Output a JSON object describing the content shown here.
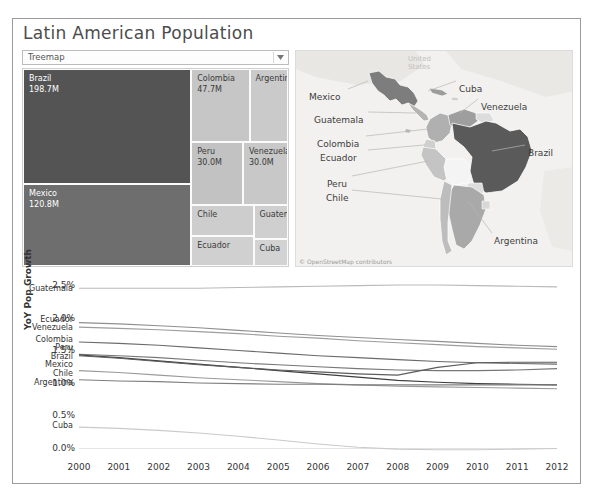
{
  "dashboard": {
    "title": "Latin American Population",
    "parameter": {
      "value": "Treemap",
      "options": [
        "Treemap",
        "Map",
        "Bar Chart"
      ],
      "arrow_icon": "chevron-down-icon"
    }
  },
  "treemap": {
    "cells": [
      {
        "name": "Brazil",
        "value": "198.7M",
        "pop": 198.7,
        "x": 0,
        "y": 0,
        "w": 63.5,
        "h": 58.5,
        "shade": "#545454",
        "tone": "dark",
        "show_value": true
      },
      {
        "name": "Mexico",
        "value": "120.8M",
        "pop": 120.8,
        "x": 0,
        "y": 58.5,
        "w": 63.5,
        "h": 41.5,
        "shade": "#6e6e6e",
        "tone": "dark",
        "show_value": true
      },
      {
        "name": "Colombia",
        "value": "47.7M",
        "pop": 47.7,
        "x": 63.5,
        "y": 0,
        "w": 22.0,
        "h": 37.0,
        "shade": "#c6c6c6",
        "tone": "light",
        "show_value": true
      },
      {
        "name": "Argentina",
        "value": "41.1M",
        "pop": 41.1,
        "x": 85.5,
        "y": 0,
        "w": 14.5,
        "h": 37.0,
        "shade": "#cacaca",
        "tone": "light",
        "show_value": false
      },
      {
        "name": "Peru",
        "value": "30.0M",
        "pop": 30.0,
        "x": 63.5,
        "y": 37.0,
        "w": 19.5,
        "h": 32.0,
        "shade": "#c2c2c2",
        "tone": "light",
        "show_value": true
      },
      {
        "name": "Venezuela",
        "value": "30.0M",
        "pop": 30.0,
        "x": 83.0,
        "y": 37.0,
        "w": 17.0,
        "h": 32.0,
        "shade": "#c8c8c8",
        "tone": "light",
        "show_value": true
      },
      {
        "name": "Chile",
        "value": "17.4M",
        "pop": 17.4,
        "x": 63.5,
        "y": 69.0,
        "w": 23.5,
        "h": 16.0,
        "shade": "#cdcdcd",
        "tone": "light",
        "show_value": false
      },
      {
        "name": "Ecuador",
        "value": "15.5M",
        "pop": 15.5,
        "x": 63.5,
        "y": 85.0,
        "w": 23.5,
        "h": 15.0,
        "shade": "#d0d0d0",
        "tone": "light",
        "show_value": false
      },
      {
        "name": "Guatemala",
        "value": "15.1M",
        "pop": 15.1,
        "x": 87.0,
        "y": 69.0,
        "w": 13.0,
        "h": 17.5,
        "shade": "#cfcfcf",
        "tone": "light",
        "show_value": false
      },
      {
        "name": "Cuba",
        "value": "11.3M",
        "pop": 11.3,
        "x": 87.0,
        "y": 86.5,
        "w": 13.0,
        "h": 13.5,
        "shade": "#d3d3d3",
        "tone": "light",
        "show_value": false
      }
    ]
  },
  "map": {
    "attribution": "© OpenStreetMap contributors",
    "labels": [
      {
        "name": "Mexico",
        "x": 13,
        "y": 41
      },
      {
        "name": "Guatemala",
        "x": 18,
        "y": 64
      },
      {
        "name": "Colombia",
        "x": 21,
        "y": 88
      },
      {
        "name": "Ecuador",
        "x": 24,
        "y": 102
      },
      {
        "name": "Peru",
        "x": 31,
        "y": 128
      },
      {
        "name": "Chile",
        "x": 30,
        "y": 142
      },
      {
        "name": "Cuba",
        "x": 163,
        "y": 33
      },
      {
        "name": "Venezuela",
        "x": 185,
        "y": 51
      },
      {
        "name": "Brazil",
        "x": 232,
        "y": 97
      },
      {
        "name": "Argentina",
        "x": 198,
        "y": 185
      }
    ],
    "region_shades": {
      "brazil": "#5a5a5a",
      "mexico": "#7d7d7d",
      "argentina": "#a9a9a9",
      "colombia": "#b0b0b0",
      "venezuela": "#9e9e9e",
      "peru": "#c4c4c4",
      "chile": "#bdbdbd",
      "ecuador": "#cfcfcf",
      "bolivia": "#f2f2f2",
      "other": "#e3e3e3"
    }
  },
  "chart_data": {
    "type": "line",
    "title": "",
    "xlabel": "",
    "ylabel": "YoY Pop Growth",
    "x": [
      2000,
      2001,
      2002,
      2003,
      2004,
      2005,
      2006,
      2007,
      2008,
      2009,
      2010,
      2011,
      2012
    ],
    "xtick_labels": [
      "2000",
      "2001",
      "2002",
      "2003",
      "2004",
      "2005",
      "2006",
      "2007",
      "2008",
      "2009",
      "2010",
      "2011",
      "2012"
    ],
    "ytick_labels": [
      "0.0%",
      "0.5%",
      "1.0%",
      "1.5%",
      "2.0%",
      "2.5%"
    ],
    "ytick_values": [
      0.0,
      0.5,
      1.0,
      1.5,
      2.0,
      2.5
    ],
    "ylim": [
      -0.1,
      2.75
    ],
    "xlim": [
      2000,
      2012
    ],
    "grid": false,
    "legend": "inline-left-labels",
    "series": [
      {
        "name": "Guatemala",
        "color": "#b9b9b9",
        "label_y": 2.48,
        "values": [
          2.47,
          2.47,
          2.47,
          2.47,
          2.48,
          2.49,
          2.5,
          2.51,
          2.52,
          2.52,
          2.51,
          2.5,
          2.49
        ]
      },
      {
        "name": "Ecuador",
        "color": "#8f8f8f",
        "label_y": 2.0,
        "values": [
          1.94,
          1.92,
          1.89,
          1.86,
          1.82,
          1.78,
          1.74,
          1.71,
          1.68,
          1.65,
          1.62,
          1.59,
          1.57
        ]
      },
      {
        "name": "Venezuela",
        "color": "#9d9d9d",
        "label_y": 1.87,
        "values": [
          1.87,
          1.85,
          1.83,
          1.8,
          1.77,
          1.73,
          1.7,
          1.66,
          1.63,
          1.6,
          1.57,
          1.55,
          1.53
        ]
      },
      {
        "name": "Colombia",
        "color": "#6b6b6b",
        "label_y": 1.69,
        "values": [
          1.64,
          1.62,
          1.59,
          1.55,
          1.51,
          1.47,
          1.43,
          1.4,
          1.37,
          1.34,
          1.32,
          1.31,
          1.3
        ]
      },
      {
        "name": "Peru",
        "color": "#777777",
        "label_y": 1.56,
        "values": [
          1.45,
          1.43,
          1.4,
          1.36,
          1.32,
          1.29,
          1.26,
          1.23,
          1.21,
          1.2,
          1.2,
          1.21,
          1.23
        ]
      },
      {
        "name": "Brazil",
        "color": "#3f3f3f",
        "label_y": 1.42,
        "values": [
          1.44,
          1.4,
          1.35,
          1.3,
          1.25,
          1.2,
          1.15,
          1.1,
          1.05,
          1.02,
          1.0,
          0.99,
          0.98
        ]
      },
      {
        "name": "Mexico",
        "color": "#5c5c5c",
        "label_y": 1.3,
        "values": [
          1.43,
          1.39,
          1.34,
          1.29,
          1.25,
          1.21,
          1.18,
          1.15,
          1.13,
          1.25,
          1.32,
          1.33,
          1.33
        ]
      },
      {
        "name": "Chile",
        "color": "#9a9a9a",
        "label_y": 1.17,
        "values": [
          1.2,
          1.17,
          1.13,
          1.09,
          1.06,
          1.03,
          1.0,
          0.98,
          0.96,
          0.95,
          0.94,
          0.93,
          0.92
        ]
      },
      {
        "name": "Argentina",
        "color": "#7f7f7f",
        "label_y": 1.02,
        "values": [
          1.06,
          1.04,
          1.03,
          1.01,
          1.0,
          0.99,
          0.99,
          0.98,
          0.98,
          0.98,
          0.98,
          0.98,
          0.98
        ]
      },
      {
        "name": "Cuba",
        "color": "#cacaca",
        "label_y": 0.36,
        "values": [
          0.33,
          0.31,
          0.28,
          0.24,
          0.19,
          0.13,
          0.07,
          0.02,
          -0.01,
          -0.02,
          -0.02,
          -0.01,
          0.0
        ]
      }
    ]
  }
}
